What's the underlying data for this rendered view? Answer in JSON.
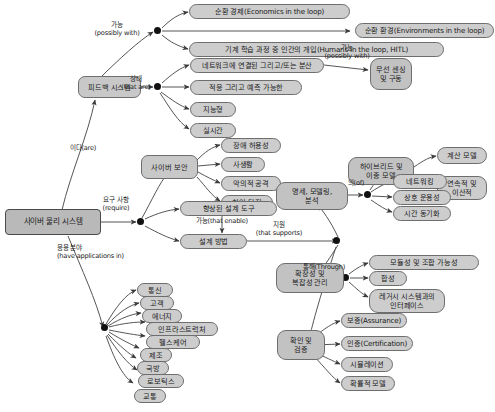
{
  "diagram": {
    "type": "mind-map",
    "colors": {
      "node_fill": "#c8c8c8",
      "node_stroke": "#6e6e6e",
      "edge": "#555555",
      "background": "#ffffff",
      "junction": "#111111"
    },
    "root": {
      "label": "사이버 물리 시스템"
    },
    "branch_labels": {
      "possibly_with": "가능\n(possibly with)",
      "that_are": "상태\n(that are)",
      "is_are": "이다(are)",
      "require": "요구 사항\n(require)",
      "have_applications_in": "응용 분야\n(have applications in)",
      "that_enable": "가능(that enable)",
      "that_supports": "지원\n(that supports)",
      "of": "의(of)",
      "through": "통해(Through)",
      "possibly_with_2": "가능\n(possibly with)"
    },
    "nodes": {
      "feedback_system": "피드백 시스템",
      "cyber_security": "사이버 보안",
      "improved_design_tools": "향상된 설계 도구",
      "design_methods": "설계 방법",
      "wireless_sensing": "무선 센싱\n및 구동",
      "spec_modeling_analysis": "명세, 모델링,\n분석",
      "scalability_complexity": "확장성 및\n복잡성 관리",
      "validation_verification": "확인 및\n검증",
      "hybrid_heterogeneous": "하이브리드 및\n이종 모델"
    },
    "loop_items": [
      "순환 경제(Economics in the loop)",
      "순환 환경(Environments in the loop)",
      "기계 학습 과정 중 인간의 개입(Humans in the loop, HITL)"
    ],
    "state_items": [
      "네트워크에 연결된 그리고/또는 분산",
      "적응 그리고 예측 가능한",
      "지능형",
      "실시간"
    ],
    "security_items": [
      "장애 허용성",
      "사생활",
      "악의적 공격",
      "침입 탐지"
    ],
    "application_items": [
      "통신",
      "고객",
      "에너지",
      "인프라스트럭처",
      "헬스케어",
      "제조",
      "국방",
      "로보틱스",
      "교통"
    ],
    "modeling_items": [
      "네트워킹",
      "상호 운용성",
      "시간 동기화"
    ],
    "hybrid_items": [
      "계산 모델",
      "연속적 및\n이산적"
    ],
    "scalability_items": [
      "모듈성 및 조합 가능성",
      "합성",
      "레거시 시스템과의\n인터페이스"
    ],
    "validation_items": [
      "보증(Assurance)",
      "인증(Certification)",
      "시뮬레이션",
      "확률적 모델"
    ]
  }
}
